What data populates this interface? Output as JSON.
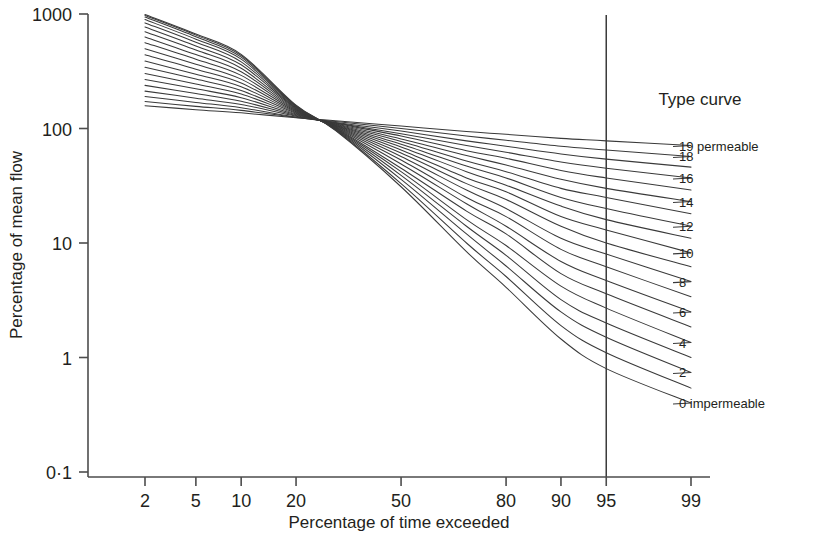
{
  "chart_data": {
    "type": "line",
    "title": "",
    "xlabel": "Percentage of time exceeded",
    "ylabel": "Percentage of mean flow",
    "xscale": "probability",
    "yscale": "log",
    "xlim": [
      1.5,
      99.6
    ],
    "ylim": [
      0.1,
      1000
    ],
    "grid": false,
    "legend_position": "right",
    "legend_title": "Type curve",
    "xticks": [
      2,
      5,
      10,
      20,
      50,
      80,
      90,
      95,
      99
    ],
    "xtick_labels": [
      "2",
      "5",
      "10",
      "20",
      "50",
      "80",
      "90",
      "95",
      "99"
    ],
    "yticks": [
      1000,
      100,
      10,
      1,
      0.1
    ],
    "ytick_labels": [
      "1000",
      "100",
      "10",
      "1",
      "0·1"
    ],
    "annotations": [
      {
        "name": "reference-line-95",
        "type": "vline",
        "x": 95,
        "label": ""
      }
    ],
    "series": [
      {
        "name": "19 permeable",
        "type_number": 19,
        "legend_label": "19 permeable",
        "x": [
          2,
          5,
          10,
          20,
          30,
          50,
          70,
          80,
          90,
          95,
          99
        ],
        "y": [
          158,
          146,
          137,
          124,
          117,
          105,
          94,
          89,
          82,
          78,
          71
        ]
      },
      {
        "name": "18",
        "type_number": 18,
        "legend_label": "18",
        "x": [
          2,
          5,
          10,
          20,
          30,
          50,
          70,
          80,
          90,
          95,
          99
        ],
        "y": [
          172,
          156,
          144,
          125,
          115,
          100,
          86,
          79,
          70,
          65,
          57
        ]
      },
      {
        "name": "17",
        "type_number": 17,
        "legend_label": "",
        "x": [
          2,
          5,
          10,
          20,
          30,
          50,
          70,
          80,
          90,
          95,
          99
        ],
        "y": [
          190,
          169,
          152,
          126,
          113,
          95,
          78,
          70,
          60,
          54,
          46
        ]
      },
      {
        "name": "16",
        "type_number": 16,
        "legend_label": "16",
        "x": [
          2,
          5,
          10,
          20,
          30,
          50,
          70,
          80,
          90,
          95,
          99
        ],
        "y": [
          212,
          184,
          162,
          128,
          112,
          90,
          71,
          62,
          51,
          45,
          37
        ]
      },
      {
        "name": "15",
        "type_number": 15,
        "legend_label": "",
        "x": [
          2,
          5,
          10,
          20,
          30,
          50,
          70,
          80,
          90,
          95,
          99
        ],
        "y": [
          238,
          202,
          173,
          130,
          111,
          86,
          64,
          55,
          43,
          37,
          29
        ]
      },
      {
        "name": "14",
        "type_number": 14,
        "legend_label": "14",
        "x": [
          2,
          5,
          10,
          20,
          30,
          50,
          70,
          80,
          90,
          95,
          99
        ],
        "y": [
          268,
          222,
          186,
          132,
          110,
          81,
          58,
          48,
          36,
          30,
          23
        ]
      },
      {
        "name": "13",
        "type_number": 13,
        "legend_label": "",
        "x": [
          2,
          5,
          10,
          20,
          30,
          50,
          70,
          80,
          90,
          95,
          99
        ],
        "y": [
          302,
          245,
          200,
          134,
          109,
          77,
          52,
          42,
          30,
          25,
          18
        ]
      },
      {
        "name": "12",
        "type_number": 12,
        "legend_label": "12",
        "x": [
          2,
          5,
          10,
          20,
          30,
          50,
          70,
          80,
          90,
          95,
          99
        ],
        "y": [
          342,
          270,
          215,
          136,
          108,
          73,
          47,
          37,
          25,
          20,
          14
        ]
      },
      {
        "name": "11",
        "type_number": 11,
        "legend_label": "",
        "x": [
          2,
          5,
          10,
          20,
          30,
          50,
          70,
          80,
          90,
          95,
          99
        ],
        "y": [
          388,
          298,
          232,
          138,
          107,
          69,
          42,
          32,
          21,
          16,
          11
        ]
      },
      {
        "name": "10",
        "type_number": 10,
        "legend_label": "10",
        "x": [
          2,
          5,
          10,
          20,
          30,
          50,
          70,
          80,
          90,
          95,
          99
        ],
        "y": [
          440,
          330,
          250,
          140,
          106,
          65,
          37,
          28,
          17,
          13,
          8.2
        ]
      },
      {
        "name": "9",
        "type_number": 9,
        "legend_label": "",
        "x": [
          2,
          5,
          10,
          20,
          30,
          50,
          70,
          80,
          90,
          95,
          99
        ],
        "y": [
          498,
          364,
          270,
          142,
          105,
          61,
          33,
          24,
          14,
          10,
          6.2
        ]
      },
      {
        "name": "8",
        "type_number": 8,
        "legend_label": "8",
        "x": [
          2,
          5,
          10,
          20,
          30,
          50,
          70,
          80,
          90,
          95,
          99
        ],
        "y": [
          562,
          402,
          291,
          144,
          104,
          57,
          29,
          20,
          11,
          8.0,
          4.6
        ]
      },
      {
        "name": "7",
        "type_number": 7,
        "legend_label": "",
        "x": [
          2,
          5,
          10,
          20,
          30,
          50,
          70,
          80,
          90,
          95,
          99
        ],
        "y": [
          630,
          442,
          313,
          146,
          103,
          53,
          25,
          17,
          8.8,
          6.2,
          3.4
        ]
      },
      {
        "name": "6",
        "type_number": 6,
        "legend_label": "6",
        "x": [
          2,
          5,
          10,
          20,
          30,
          50,
          70,
          80,
          90,
          95,
          99
        ],
        "y": [
          700,
          484,
          336,
          148,
          102,
          49,
          22,
          14,
          6.9,
          4.7,
          2.5
        ]
      },
      {
        "name": "5",
        "type_number": 5,
        "legend_label": "",
        "x": [
          2,
          5,
          10,
          20,
          30,
          50,
          70,
          80,
          90,
          95,
          99
        ],
        "y": [
          770,
          526,
          360,
          150,
          101,
          45,
          19,
          12,
          5.4,
          3.6,
          1.85
        ]
      },
      {
        "name": "4",
        "type_number": 4,
        "legend_label": "4",
        "x": [
          2,
          5,
          10,
          20,
          30,
          50,
          70,
          80,
          90,
          95,
          99
        ],
        "y": [
          836,
          566,
          382,
          152,
          100,
          42,
          16,
          9.5,
          4.2,
          2.7,
          1.35
        ]
      },
      {
        "name": "3",
        "type_number": 3,
        "legend_label": "",
        "x": [
          2,
          5,
          10,
          20,
          30,
          50,
          70,
          80,
          90,
          95,
          99
        ],
        "y": [
          894,
          602,
          403,
          154,
          99,
          39,
          14,
          7.8,
          3.2,
          2.0,
          1.0
        ]
      },
      {
        "name": "2",
        "type_number": 2,
        "legend_label": "2",
        "x": [
          2,
          5,
          10,
          20,
          30,
          50,
          70,
          80,
          90,
          95,
          99
        ],
        "y": [
          940,
          632,
          420,
          156,
          98,
          36,
          12,
          6.3,
          2.5,
          1.5,
          0.74
        ]
      },
      {
        "name": "1",
        "type_number": 1,
        "legend_label": "",
        "x": [
          2,
          5,
          10,
          20,
          30,
          50,
          70,
          80,
          90,
          95,
          99
        ],
        "y": [
          972,
          654,
          434,
          158,
          97,
          33,
          10,
          5.1,
          1.9,
          1.1,
          0.54
        ]
      },
      {
        "name": "0 impermeable",
        "type_number": 0,
        "legend_label": "0 impermeable",
        "x": [
          2,
          5,
          10,
          20,
          30,
          50,
          70,
          80,
          90,
          95,
          99
        ],
        "y": [
          990,
          668,
          444,
          160,
          96,
          31,
          8.4,
          4.1,
          1.45,
          0.8,
          0.4
        ]
      }
    ]
  },
  "axes": {
    "x_title": "Percentage of time exceeded",
    "y_title": "Percentage of mean flow"
  },
  "legend": {
    "title": "Type curve",
    "entries": [
      {
        "label": "19 permeable",
        "type_number": 19
      },
      {
        "label": "18",
        "type_number": 18
      },
      {
        "label": "16",
        "type_number": 16
      },
      {
        "label": "14",
        "type_number": 14
      },
      {
        "label": "12",
        "type_number": 12
      },
      {
        "label": "10",
        "type_number": 10
      },
      {
        "label": "8",
        "type_number": 8
      },
      {
        "label": "6",
        "type_number": 6
      },
      {
        "label": "4",
        "type_number": 4
      },
      {
        "label": "2",
        "type_number": 2
      },
      {
        "label": "0 impermeable",
        "type_number": 0
      }
    ]
  },
  "style": {
    "curve_color": "#3a3a3a",
    "axis_color": "#4d4d4d",
    "text_color": "#231f20",
    "background": "#ffffff"
  }
}
